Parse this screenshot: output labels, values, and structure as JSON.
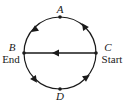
{
  "diagram": {
    "colors": {
      "stroke": "#1a1a1a",
      "background": "#ffffff"
    },
    "circle": {
      "cx": 60,
      "cy": 53,
      "r": 36
    },
    "points": {
      "A": {
        "label": "A",
        "x": 60,
        "y": 17
      },
      "B": {
        "label": "B",
        "sublabel": "End",
        "x": 24,
        "y": 53
      },
      "C": {
        "label": "C",
        "sublabel": "Start",
        "x": 96,
        "y": 53
      },
      "D": {
        "label": "D",
        "x": 60,
        "y": 89
      }
    },
    "paths": [
      {
        "name": "C-A-B upper arc",
        "direction": "counterclockwise"
      },
      {
        "name": "C-B diameter",
        "direction": "leftward"
      },
      {
        "name": "B-D-C lower arc",
        "direction": "counterclockwise"
      }
    ]
  }
}
